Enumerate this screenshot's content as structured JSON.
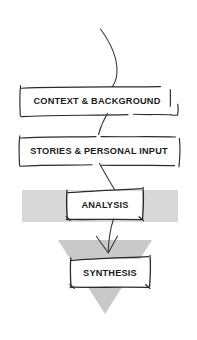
{
  "diagram": {
    "style": "hand-drawn sketch flowchart",
    "canvas": {
      "width": 197,
      "height": 340,
      "background": "#ffffff"
    },
    "colors": {
      "stroke": "#2a2a2a",
      "arrow": "#3a3a3a",
      "text": "#1b1b1b",
      "band_gray": "#d9d9d9",
      "triangle_gray": "#c9c9c9",
      "box_fill": "#ffffff"
    },
    "nodes": [
      {
        "id": "context",
        "label": "CONTEXT & BACKGROUND",
        "font_size": 9.2,
        "box": {
          "x": 18,
          "y": 86,
          "width": 160,
          "height": 30
        },
        "center": {
          "x": 98,
          "y": 101
        }
      },
      {
        "id": "stories",
        "label": "STORIES & PERSONAL INPUT",
        "font_size": 9.2,
        "box": {
          "x": 18,
          "y": 136,
          "width": 162,
          "height": 30
        },
        "center": {
          "x": 99,
          "y": 151
        }
      },
      {
        "id": "analysis",
        "label": "ANALYSIS",
        "font_size": 9.2,
        "box": {
          "x": 67,
          "y": 190,
          "width": 76,
          "height": 30
        },
        "center": {
          "x": 105,
          "y": 205
        }
      },
      {
        "id": "synthesis",
        "label": "SYNTHESIS",
        "font_size": 9.2,
        "box": {
          "x": 71,
          "y": 258,
          "width": 79,
          "height": 30
        },
        "center": {
          "x": 110,
          "y": 273
        }
      }
    ],
    "shapes": [
      {
        "id": "analysis-band",
        "kind": "rectangle",
        "fill": "#d9d9d9",
        "x": 22,
        "y": 190,
        "width": 156,
        "height": 32
      },
      {
        "id": "synthesis-triangle",
        "kind": "triangle-down",
        "fill": "#c9c9c9",
        "left_x": 58,
        "right_x": 152,
        "top_y": 240,
        "apex_x": 105,
        "apex_y": 314
      }
    ],
    "connectors": [
      {
        "id": "inflow-curve",
        "from": "top",
        "to": "context",
        "shape": "arc"
      },
      {
        "id": "context-to-stories",
        "from": "context",
        "to": "stories",
        "shape": "diagonal"
      },
      {
        "id": "stories-to-analysis",
        "from": "stories",
        "to": "analysis",
        "shape": "diagonal"
      },
      {
        "id": "analysis-to-synthesis",
        "from": "analysis",
        "to": "synthesis",
        "shape": "arrow-down"
      }
    ]
  }
}
